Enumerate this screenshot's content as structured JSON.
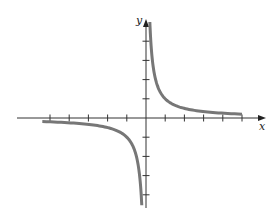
{
  "chart_data": {
    "type": "line",
    "title": "",
    "function": "y = 1/x",
    "xlabel": "x",
    "ylabel": "y",
    "x_ticks": [
      -5,
      -4,
      -3,
      -2,
      -1,
      1,
      2,
      3,
      4,
      5
    ],
    "y_ticks": [
      -4,
      -3,
      -2,
      -1,
      1,
      2,
      3,
      4
    ],
    "tick_labels_shown": false,
    "xlim": [
      -5.5,
      5.5
    ],
    "ylim": [
      -4.7,
      5
    ],
    "grid": false,
    "legend": null,
    "series": [
      {
        "name": "right branch",
        "x": [
          0.2,
          0.25,
          0.33,
          0.5,
          1,
          1.5,
          2,
          3,
          4,
          5
        ],
        "y": [
          5,
          4,
          3,
          2,
          1,
          0.67,
          0.5,
          0.33,
          0.25,
          0.2
        ]
      },
      {
        "name": "left branch",
        "x": [
          -5.4,
          -5,
          -4,
          -3,
          -2,
          -1.5,
          -1,
          -0.5,
          -0.33,
          -0.25,
          -0.22
        ],
        "y": [
          -0.19,
          -0.2,
          -0.25,
          -0.33,
          -0.5,
          -0.67,
          -1,
          -2,
          -3,
          -4,
          -4.5
        ]
      }
    ],
    "colors": {
      "curve": "#777777",
      "axes": "#333333"
    }
  },
  "labels": {
    "x": "x",
    "y": "y"
  }
}
